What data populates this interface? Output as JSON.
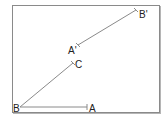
{
  "diagram": {
    "type": "geometry-vectors",
    "stroke_color": "#8a8a8a",
    "points": {
      "B": {
        "label": "B",
        "x": 20,
        "y": 107
      },
      "A": {
        "label": "A",
        "x": 87,
        "y": 107
      },
      "C": {
        "label": "C",
        "x": 73,
        "y": 63
      },
      "A_prime": {
        "label": "A'",
        "x": 78,
        "y": 45
      },
      "B_prime": {
        "label": "B'",
        "x": 136,
        "y": 10
      }
    },
    "segments": [
      {
        "from": "B",
        "to": "A"
      },
      {
        "from": "B",
        "to": "C"
      },
      {
        "from": "A_prime",
        "to": "B_prime"
      }
    ]
  }
}
